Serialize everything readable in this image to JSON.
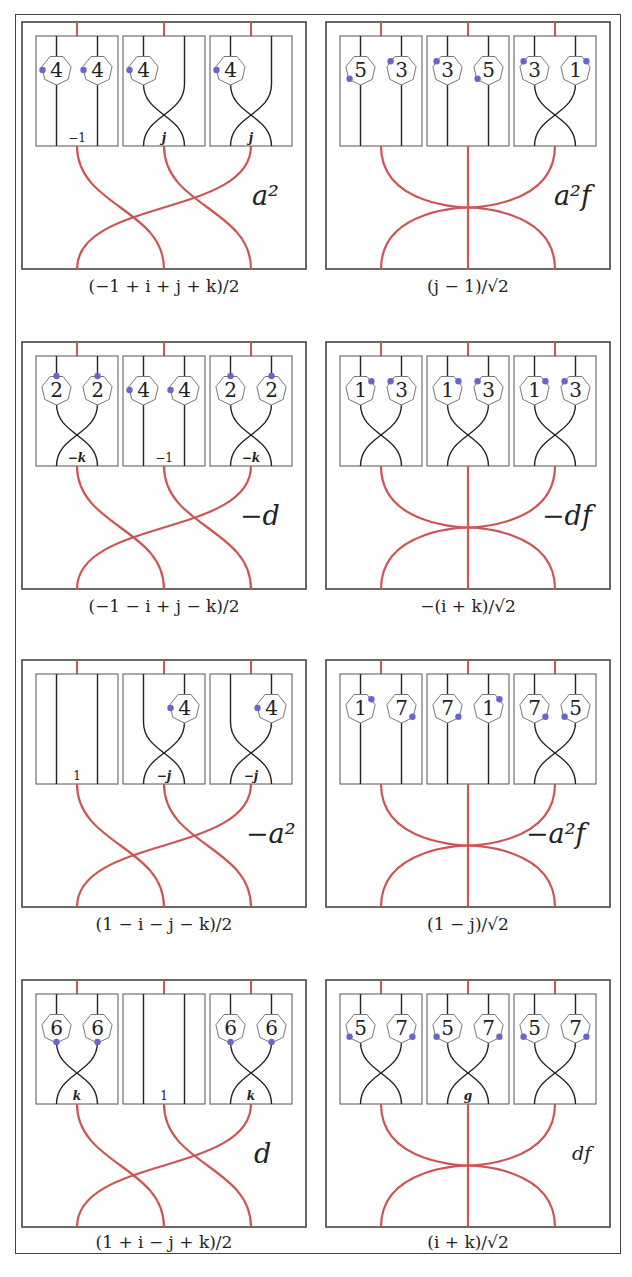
{
  "colors": {
    "frame": "#444444",
    "box": "#555555",
    "strand": "#222222",
    "red_strand": "#cc5555",
    "dot": "#6666cc",
    "heptagon_stroke": "#777777"
  },
  "layout": {
    "col_x": [
      22,
      326
    ],
    "row_y": [
      22,
      342,
      660,
      980
    ],
    "panel_w": 284,
    "panel_h": 247,
    "subbox_y_off": 14,
    "subbox_h": 110,
    "subbox_w": 82,
    "subbox_x_off": [
      14,
      101,
      188
    ]
  },
  "panels": [
    {
      "id": "p1",
      "row": 0,
      "col": 0,
      "label": "a²",
      "caption": "(−1 + i + j + k)/2",
      "red": "braid3",
      "boxes": [
        {
          "strands": "straight",
          "label": "−1",
          "nodes": [
            {
              "n": "4",
              "s": 0,
              "dot": "left"
            },
            {
              "n": "4",
              "s": 1,
              "dot": "left"
            }
          ]
        },
        {
          "strands": "cross",
          "label": "j",
          "nodes": [
            {
              "n": "4",
              "s": 0,
              "dot": "left"
            }
          ]
        },
        {
          "strands": "cross",
          "label": "j",
          "nodes": [
            {
              "n": "4",
              "s": 0,
              "dot": "left"
            }
          ]
        }
      ]
    },
    {
      "id": "p2",
      "row": 0,
      "col": 1,
      "label": "a²f",
      "caption": "(j − 1)/√2",
      "red": "star3",
      "boxes": [
        {
          "strands": "straight",
          "label": "",
          "nodes": [
            {
              "n": "5",
              "s": 0,
              "dot": "bottom-left"
            },
            {
              "n": "3",
              "s": 1,
              "dot": "top-left"
            }
          ]
        },
        {
          "strands": "straight",
          "label": "",
          "nodes": [
            {
              "n": "3",
              "s": 0,
              "dot": "top-left"
            },
            {
              "n": "5",
              "s": 1,
              "dot": "bottom-left"
            }
          ]
        },
        {
          "strands": "cross",
          "label": "",
          "nodes": [
            {
              "n": "3",
              "s": 0,
              "dot": "top-left"
            },
            {
              "n": "1",
              "s": 1,
              "dot": "top-right"
            }
          ]
        }
      ]
    },
    {
      "id": "p3",
      "row": 1,
      "col": 0,
      "label": "−d",
      "caption": "(−1 − i + j − k)/2",
      "red": "braid3",
      "boxes": [
        {
          "strands": "cross",
          "label": "−k",
          "nodes": [
            {
              "n": "2",
              "s": 0,
              "dot": "top"
            },
            {
              "n": "2",
              "s": 1,
              "dot": "top"
            }
          ]
        },
        {
          "strands": "straight",
          "label": "−1",
          "nodes": [
            {
              "n": "4",
              "s": 0,
              "dot": "left"
            },
            {
              "n": "4",
              "s": 1,
              "dot": "left"
            }
          ]
        },
        {
          "strands": "cross",
          "label": "−k",
          "nodes": [
            {
              "n": "2",
              "s": 0,
              "dot": "top"
            },
            {
              "n": "2",
              "s": 1,
              "dot": "top"
            }
          ]
        }
      ]
    },
    {
      "id": "p4",
      "row": 1,
      "col": 1,
      "label": "−df",
      "caption": "−(i + k)/√2",
      "red": "star3",
      "boxes": [
        {
          "strands": "cross",
          "label": "",
          "nodes": [
            {
              "n": "1",
              "s": 0,
              "dot": "top-right"
            },
            {
              "n": "3",
              "s": 1,
              "dot": "top-left"
            }
          ]
        },
        {
          "strands": "cross",
          "label": "",
          "nodes": [
            {
              "n": "1",
              "s": 0,
              "dot": "top-right"
            },
            {
              "n": "3",
              "s": 1,
              "dot": "top-left"
            }
          ]
        },
        {
          "strands": "cross",
          "label": "",
          "nodes": [
            {
              "n": "1",
              "s": 0,
              "dot": "top-right"
            },
            {
              "n": "3",
              "s": 1,
              "dot": "top-left"
            }
          ]
        }
      ]
    },
    {
      "id": "p5",
      "row": 2,
      "col": 0,
      "label": "−a²",
      "caption": "(1 − i − j − k)/2",
      "red": "braid3",
      "boxes": [
        {
          "strands": "straight",
          "label": "1",
          "nodes": []
        },
        {
          "strands": "cross",
          "label": "−j",
          "nodes": [
            {
              "n": "4",
              "s": 1,
              "dot": "left"
            }
          ]
        },
        {
          "strands": "cross",
          "label": "−j",
          "nodes": [
            {
              "n": "4",
              "s": 1,
              "dot": "left"
            }
          ]
        }
      ]
    },
    {
      "id": "p6",
      "row": 2,
      "col": 1,
      "label": "−a²f",
      "caption": "(1 − j)/√2",
      "red": "star3",
      "boxes": [
        {
          "strands": "straight",
          "label": "",
          "nodes": [
            {
              "n": "1",
              "s": 0,
              "dot": "top-right"
            },
            {
              "n": "7",
              "s": 1,
              "dot": "bottom-right"
            }
          ]
        },
        {
          "strands": "straight",
          "label": "",
          "nodes": [
            {
              "n": "7",
              "s": 0,
              "dot": "bottom-right"
            },
            {
              "n": "1",
              "s": 1,
              "dot": "top-right"
            }
          ]
        },
        {
          "strands": "cross",
          "label": "",
          "nodes": [
            {
              "n": "7",
              "s": 0,
              "dot": "bottom-right"
            },
            {
              "n": "5",
              "s": 1,
              "dot": "bottom-left"
            }
          ]
        }
      ]
    },
    {
      "id": "p7",
      "row": 3,
      "col": 0,
      "label": "d",
      "caption": "(1 + i − j + k)/2",
      "red": "braid3",
      "boxes": [
        {
          "strands": "cross",
          "label": "k",
          "nodes": [
            {
              "n": "6",
              "s": 0,
              "dot": "bottom"
            },
            {
              "n": "6",
              "s": 1,
              "dot": "bottom"
            }
          ]
        },
        {
          "strands": "straight",
          "label": "1",
          "nodes": []
        },
        {
          "strands": "cross",
          "label": "k",
          "nodes": [
            {
              "n": "6",
              "s": 0,
              "dot": "bottom"
            },
            {
              "n": "6",
              "s": 1,
              "dot": "bottom"
            }
          ]
        }
      ]
    },
    {
      "id": "p8",
      "row": 3,
      "col": 1,
      "label": "df",
      "caption": "(i + k)/√2",
      "red": "star3",
      "boxes": [
        {
          "strands": "cross",
          "label": "",
          "nodes": [
            {
              "n": "5",
              "s": 0,
              "dot": "bottom-left"
            },
            {
              "n": "7",
              "s": 1,
              "dot": "bottom-right"
            }
          ]
        },
        {
          "strands": "cross",
          "label": "g",
          "nodes": [
            {
              "n": "5",
              "s": 0,
              "dot": "bottom-left"
            },
            {
              "n": "7",
              "s": 1,
              "dot": "bottom-right"
            }
          ]
        },
        {
          "strands": "cross",
          "label": "",
          "nodes": [
            {
              "n": "5",
              "s": 0,
              "dot": "bottom-left"
            },
            {
              "n": "7",
              "s": 1,
              "dot": "bottom-right"
            }
          ]
        }
      ]
    }
  ],
  "captions": {
    "p1": "(−1 + i + j + k)/2",
    "p2": "(j − 1)/√2",
    "p3": "(−1 − i + j − k)/2",
    "p4": "−(i + k)/√2",
    "p5": "(1 − i − j − k)/2",
    "p6": "(1 − j)/√2",
    "p7": "(1 + i − j + k)/2",
    "p8": "(i + k)/√2"
  },
  "labels": {
    "p1": "a²",
    "p2": "a²f",
    "p3": "−d",
    "p4": "−df",
    "p5": "−a²",
    "p6": "−a²f",
    "p7": "d",
    "p8": "df"
  }
}
